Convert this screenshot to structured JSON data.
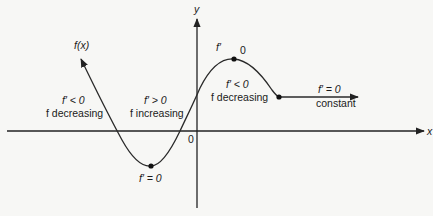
{
  "diagram": {
    "type": "function-derivative-sign-diagram",
    "axes": {
      "x_label": "x",
      "y_label": "y",
      "origin_label": "0"
    },
    "curve_label": "f(x)",
    "regions": [
      {
        "name": "left-decreasing",
        "derivative": "f′ < 0",
        "behavior": "f decreasing"
      },
      {
        "name": "increasing",
        "derivative": "f′ > 0",
        "behavior": "f increasing"
      },
      {
        "name": "right-decreasing",
        "derivative": "f′ < 0",
        "behavior": "f decreasing"
      },
      {
        "name": "constant",
        "derivative": "f′ = 0",
        "behavior": "constant"
      }
    ],
    "critical_points": {
      "minimum": {
        "label": "f′ = 0"
      },
      "maximum": {
        "label_left": "f′",
        "label_right": "0"
      }
    },
    "colors": {
      "background": "#f7f7f5",
      "ink": "#222222"
    }
  }
}
